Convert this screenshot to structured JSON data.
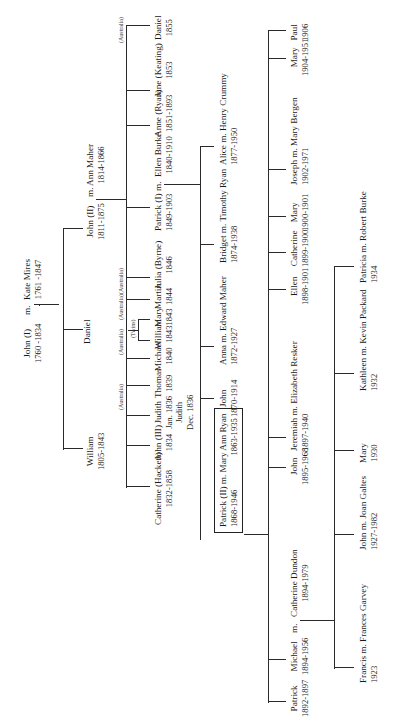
{
  "diagram": {
    "type": "family-tree",
    "orientation": "rotated 90 degrees counter-clockwise",
    "line_color": "#2a2a2a",
    "text_color": "#1a1a1a"
  },
  "gen1": {
    "couple": {
      "name": "John (I)",
      "dates": "1760 -1834",
      "marker": "m.",
      "spouse": "Kate Mires",
      "spouse_dates": "1761 -1847"
    },
    "children": [
      {
        "name": "William",
        "dates": "1805-1843"
      },
      {
        "name": "Daniel",
        "dates": ""
      },
      {
        "name": "John (II)",
        "dates": "1811-1875",
        "marker": "m.",
        "spouse": "Ann Maher",
        "spouse_dates": "1814-1866"
      }
    ]
  },
  "gen2": {
    "parents": "John (II) m. Ann Maher",
    "children": [
      {
        "name": "Catherine (Hackett)",
        "dates": "1832-1858",
        "tag": ""
      },
      {
        "name": "John (III)",
        "dates": "1834",
        "tag": ""
      },
      {
        "name": "Judith",
        "dates": "Jan. 1836",
        "extra_name": "Judith",
        "extra_dates": "Dec. 1836",
        "tag": ""
      },
      {
        "name": "Thomas",
        "dates": "1839",
        "tag": "(Australia)"
      },
      {
        "name": "Michael",
        "dates": "1840",
        "tag": ""
      },
      {
        "name": "William",
        "dates": "1843",
        "tag": "(Australia)"
      },
      {
        "name": "Mary",
        "dates": "1843",
        "tag": ""
      },
      {
        "name": "Martin",
        "dates": "1844",
        "tag": "(Australia)"
      },
      {
        "name": "Julia (Byrne)",
        "dates": "1846",
        "tag": "(Australia)"
      },
      {
        "name": "Patrick (I)",
        "dates": "1849-1903",
        "marker": "m.",
        "spouse": "Ellen Burke",
        "spouse_dates": "1840-1910",
        "tag": ""
      },
      {
        "name": "Anne (Ryan)",
        "dates": "1851-1893",
        "tag": ""
      },
      {
        "name": "Jane (Keating)",
        "dates": "1853",
        "tag": ""
      },
      {
        "name": "Daniel",
        "dates": "1855",
        "tag": "(Australia)"
      }
    ],
    "twins_label": "(Twins)"
  },
  "gen3": {
    "parents": "Patrick (I) m. Ellen Burke",
    "children": [
      {
        "name": "Patrick (II)",
        "dates": "1868-1946",
        "marker": "m.",
        "spouse": "Mary Ann Ryan",
        "spouse_dates": "1863-1935",
        "boxed": true
      },
      {
        "name": "John",
        "dates": "1870-1914"
      },
      {
        "name": "Anna",
        "dates": "1872-1927",
        "marker": "m.",
        "spouse": "Edward Maher"
      },
      {
        "name": "Bridget",
        "dates": "1874-1938",
        "marker": "m.",
        "spouse": "Timothy Ryan"
      },
      {
        "name": "Alice",
        "dates": "1877-1950",
        "marker": "m.",
        "spouse": "Henry Crummy"
      }
    ]
  },
  "gen4": {
    "parents": "Patrick (II) m. Mary Ann Ryan",
    "children": [
      {
        "name": "Patrick",
        "dates": "1892-1897"
      },
      {
        "name": "Michael",
        "dates": "1894-1956",
        "marker": "m.",
        "spouse": "Catherine Dundon",
        "spouse_dates": "1894-1979"
      },
      {
        "name": "John",
        "dates": "1895-1968"
      },
      {
        "name": "Jeremiah",
        "dates": "1897-1940",
        "marker": "m.",
        "spouse": "Elizabeth Resker"
      },
      {
        "name": "Ellen",
        "dates": "1898-1901"
      },
      {
        "name": "Catherine",
        "dates": "1899-1900"
      },
      {
        "name": "Mary",
        "dates": "1900-1901"
      },
      {
        "name": "Joseph",
        "dates": "1902-1971",
        "marker": "m.",
        "spouse": "Mary Bergen"
      },
      {
        "name": "Mary",
        "dates": "1904-1951"
      },
      {
        "name": "Paul",
        "dates": "1906"
      }
    ]
  },
  "gen5": {
    "parents": "Michael m. Catherine Dundon",
    "children": [
      {
        "name": "Francis",
        "dates": "1923",
        "marker": "m.",
        "spouse": "Frances Garvey"
      },
      {
        "name": "John",
        "dates": "1927-1982",
        "marker": "m.",
        "spouse": "Joan Galtes"
      },
      {
        "name": "Mary",
        "dates": "1930"
      },
      {
        "name": "Kathleen",
        "dates": "1932",
        "marker": "m.",
        "spouse": "Kevin Packard"
      },
      {
        "name": "Patricia",
        "dates": "1934",
        "marker": "m.",
        "spouse": "Robert Burke"
      }
    ]
  }
}
